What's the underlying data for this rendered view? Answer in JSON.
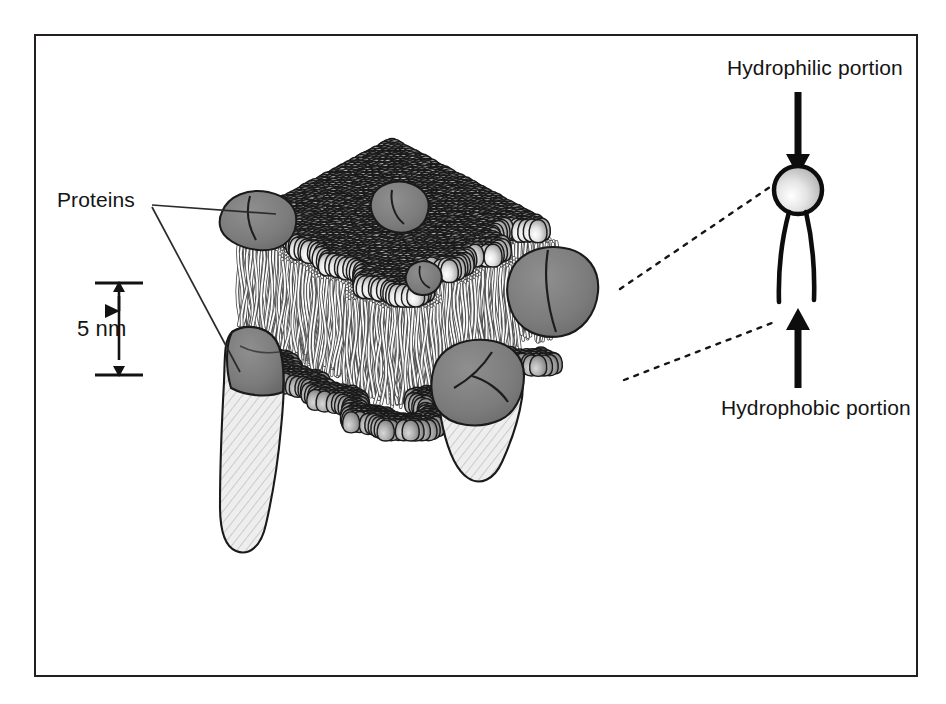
{
  "figure": {
    "border_color": "#231f20",
    "background_color": "#ffffff"
  },
  "labels": {
    "hydrophilic": "Hydrophilic portion",
    "hydrophobic": "Hydrophobic portion",
    "proteins": "Proteins",
    "scale": "5 nm"
  },
  "icons": {
    "arrow_down": "arrow-down-icon",
    "arrow_up": "arrow-up-icon",
    "scale_bar": "scale-bar-icon",
    "leader_line": "leader-line-icon",
    "dotted_connector": "dotted-connector-icon"
  },
  "colors": {
    "outline": "#1a1a1a",
    "head_light": "#f2f2f2",
    "head_mid": "#b9b9b9",
    "head_dark": "#8a8a8a",
    "lower_head_light": "#cfcfcf",
    "lower_head_dark": "#6f6f6f",
    "protein_fill": "#7a7a7a",
    "protein_cut_face": "#e8e8e8",
    "tail_stroke": "#fdfdfd",
    "tail_shadow": "#585858",
    "text": "#141414"
  },
  "diagram": {
    "type": "fluid-mosaic-membrane",
    "bilayer": {
      "thickness_label": "5 nm",
      "upper_leaflet": "phospholipid heads facing outward",
      "lower_leaflet": "phospholipid heads facing inward",
      "tails": "hydrophobic fatty acid tails"
    },
    "proteins": [
      {
        "name": "peripheral-protein-left",
        "kind": "surface",
        "cx": 258,
        "cy": 219,
        "rx": 40,
        "ry": 29
      },
      {
        "name": "peripheral-protein-top",
        "kind": "surface",
        "cx": 398,
        "cy": 208,
        "rx": 31,
        "ry": 24
      },
      {
        "name": "peripheral-protein-small",
        "kind": "surface",
        "cx": 423,
        "cy": 281,
        "rx": 19,
        "ry": 15
      },
      {
        "name": "integral-protein-right",
        "kind": "integral",
        "cx": 552,
        "cy": 296,
        "rx": 47,
        "ry": 40
      },
      {
        "name": "integral-protein-center",
        "kind": "integral",
        "cx": 480,
        "cy": 392,
        "rx": 51,
        "ry": 41
      },
      {
        "name": "integral-protein-left",
        "kind": "integral",
        "cx": 244,
        "cy": 400,
        "rx": 34,
        "ry": 60
      }
    ],
    "inset": {
      "name": "single-phospholipid",
      "head": {
        "cx": 798,
        "cy": 190,
        "r": 24
      },
      "tails": 2,
      "arrow_top": {
        "x": 798,
        "y0": 92,
        "y1": 160
      },
      "arrow_bottom": {
        "x": 798,
        "y0": 388,
        "y1": 312
      }
    },
    "connectors": [
      {
        "name": "connector-head",
        "from": [
          620,
          288
        ],
        "to": [
          768,
          186
        ]
      },
      {
        "name": "connector-tails",
        "from": [
          625,
          378
        ],
        "to": [
          770,
          322
        ]
      }
    ],
    "scale_bar": {
      "x": 116,
      "top": 283,
      "bottom": 375
    },
    "protein_leaders": [
      {
        "from": [
          150,
          203
        ],
        "to": [
          268,
          214
        ]
      },
      {
        "from": [
          150,
          205
        ],
        "to": [
          236,
          370
        ]
      }
    ]
  }
}
